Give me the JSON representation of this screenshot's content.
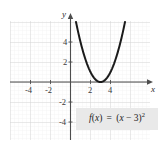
{
  "figure": {
    "name": "parabola-graph",
    "background_color": "#ffffff"
  },
  "equation": {
    "label": "f(x) = (x − 3)²",
    "fx_part": "f",
    "box_color": "#e9e9e9"
  },
  "axes": {
    "x_name": "x",
    "y_name": "y",
    "x_ticks": [
      "-4",
      "-2",
      "2",
      "4"
    ],
    "y_ticks": [
      "4",
      "2",
      "-2",
      "-4"
    ],
    "axis_color": "#4d4d4d",
    "grid_major_color": "#cfcfcf",
    "grid_minor_color": "#ebebeb"
  },
  "curve": {
    "color": "#1a1a1a",
    "width_px": 2.0
  },
  "chart_data": {
    "type": "line",
    "title": "",
    "subtitle": "",
    "xlabel": "x",
    "ylabel": "y",
    "xlim": [
      -6,
      8
    ],
    "ylim": [
      -6,
      6
    ],
    "grid": true,
    "grid_major_step": 2,
    "grid_minor_step": 0.4,
    "legend": "none",
    "annotations": [
      {
        "text": "f(x) = (x − 3)²",
        "x": 5.2,
        "y": -3.5,
        "style": "boxed"
      }
    ],
    "xticks": [
      -4,
      -2,
      2,
      4
    ],
    "yticks": [
      4,
      2,
      -2,
      -4
    ],
    "series": [
      {
        "name": "f(x) = (x - 3)^2",
        "equation": "f(x) = (x - 3)^2",
        "vertex": [
          3,
          0
        ],
        "x": [
          0.55,
          0.8,
          1.1,
          1.4,
          1.7,
          2.0,
          2.3,
          2.6,
          3.0,
          3.4,
          3.7,
          4.0,
          4.3,
          4.6,
          4.9,
          5.2,
          5.45
        ],
        "values": [
          6.0,
          4.84,
          3.61,
          2.56,
          1.69,
          1.0,
          0.49,
          0.16,
          0.0,
          0.16,
          0.49,
          1.0,
          1.69,
          2.56,
          3.61,
          4.84,
          6.0
        ]
      }
    ]
  }
}
